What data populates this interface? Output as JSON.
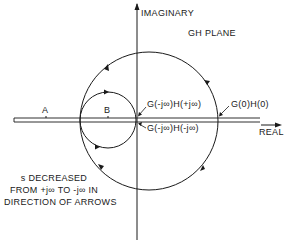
{
  "diagram": {
    "plane_title": "GH PLANE",
    "axes": {
      "imaginary_label": "IMAGINARY",
      "real_label": "REAL"
    },
    "points": {
      "a_label": "A",
      "b_label": "B"
    },
    "annotations": {
      "g_minus_jinf_h_plus_jinf": "G(-j∞)H(+j∞)",
      "g_minus_jinf_h_minus_jinf": "G(-j∞)H(-j∞)",
      "g0_h0": "G(0)H(0)"
    },
    "note": {
      "line1": "s DECREASED",
      "line2": "FROM +j∞ TO -j∞ IN",
      "line3": "DIRECTION OF ARROWS"
    },
    "colors": {
      "stroke": "#1a1a1a",
      "background": "#ffffff"
    }
  }
}
